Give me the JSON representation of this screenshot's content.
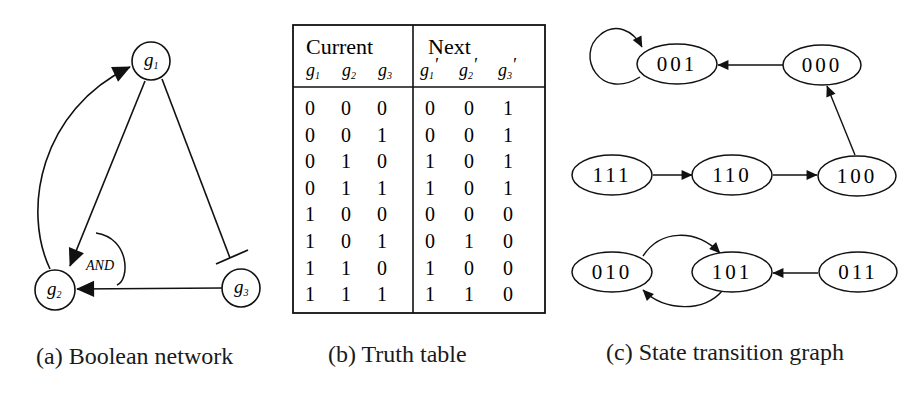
{
  "panel_a": {
    "caption": "(a) Boolean network",
    "nodes": [
      {
        "id": "g1",
        "base": "g",
        "sub": "1"
      },
      {
        "id": "g2",
        "base": "g",
        "sub": "2"
      },
      {
        "id": "g3",
        "base": "g",
        "sub": "3"
      }
    ],
    "edges": [
      {
        "from": "g2",
        "to": "g1",
        "type": "activation"
      },
      {
        "from": "g1",
        "to": "g2",
        "type": "activation"
      },
      {
        "from": "g3",
        "to": "g2",
        "type": "activation"
      },
      {
        "from": "g1",
        "to": "g3",
        "type": "inhibition"
      }
    ],
    "gate_label": "AND"
  },
  "panel_b": {
    "caption": "(b) Truth table",
    "group_headers": [
      "Current",
      "Next"
    ],
    "columns": [
      {
        "base": "g",
        "sub": "1",
        "prime": ""
      },
      {
        "base": "g",
        "sub": "2",
        "prime": ""
      },
      {
        "base": "g",
        "sub": "3",
        "prime": ""
      },
      {
        "base": "g",
        "sub": "1",
        "prime": "′"
      },
      {
        "base": "g",
        "sub": "2",
        "prime": "′"
      },
      {
        "base": "g",
        "sub": "3",
        "prime": "′"
      }
    ],
    "rows": [
      [
        "0",
        "0",
        "0",
        "0",
        "0",
        "1"
      ],
      [
        "0",
        "0",
        "1",
        "0",
        "0",
        "1"
      ],
      [
        "0",
        "1",
        "0",
        "1",
        "0",
        "1"
      ],
      [
        "0",
        "1",
        "1",
        "1",
        "0",
        "1"
      ],
      [
        "1",
        "0",
        "0",
        "0",
        "0",
        "0"
      ],
      [
        "1",
        "0",
        "1",
        "0",
        "1",
        "0"
      ],
      [
        "1",
        "1",
        "0",
        "1",
        "0",
        "0"
      ],
      [
        "1",
        "1",
        "1",
        "1",
        "1",
        "0"
      ]
    ]
  },
  "panel_c": {
    "caption": "(c) State transition graph",
    "states": {
      "s001": "001",
      "s000": "000",
      "s111": "111",
      "s110": "110",
      "s100": "100",
      "s010": "010",
      "s101": "101",
      "s011": "011"
    },
    "transitions": [
      [
        "001",
        "001"
      ],
      [
        "000",
        "001"
      ],
      [
        "100",
        "000"
      ],
      [
        "111",
        "110"
      ],
      [
        "110",
        "100"
      ],
      [
        "010",
        "101"
      ],
      [
        "101",
        "010"
      ],
      [
        "011",
        "101"
      ]
    ]
  }
}
